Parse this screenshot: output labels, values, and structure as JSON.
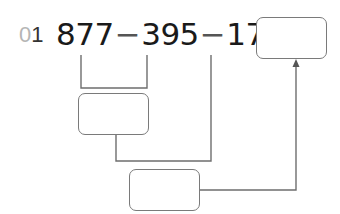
{
  "problem": {
    "number_prefix": "0",
    "number_digit": "1",
    "expression": {
      "a": "877",
      "op1": "−",
      "b": "395",
      "op2": "−",
      "c": "176",
      "equals": "="
    },
    "boxes": {
      "answer": "",
      "step1": "",
      "step2": ""
    }
  },
  "colors": {
    "line": "#6e6e6e",
    "box_border": "#7a7a7a",
    "text": "#1a1a1a",
    "prefix_gray": "#b5b5b5"
  }
}
